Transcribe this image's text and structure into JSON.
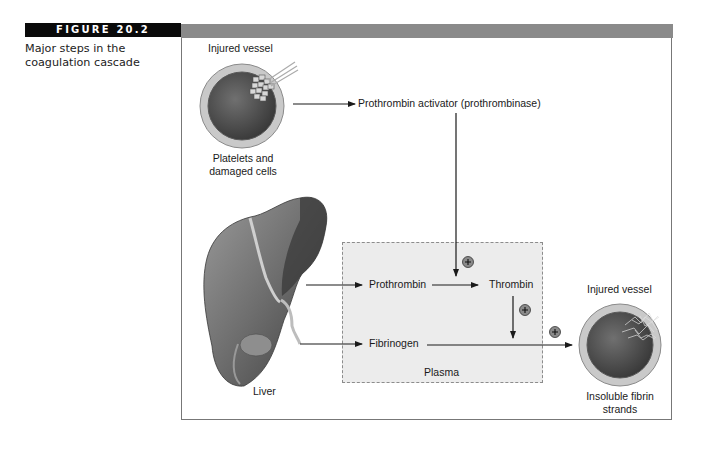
{
  "figure": {
    "number_label": "FIGURE 20.2",
    "caption_line1": "Major steps in the",
    "caption_line2": "coagulation cascade"
  },
  "diagram": {
    "injured_vessel_top": {
      "title": "Injured vessel",
      "sublabel_line1": "Platelets and",
      "sublabel_line2": "damaged cells"
    },
    "activator_label": "Prothrombin activator (prothrombinase)",
    "liver_label": "Liver",
    "plasma": {
      "label": "Plasma",
      "prothrombin": "Prothrombin",
      "thrombin": "Thrombin",
      "fibrinogen": "Fibrinogen"
    },
    "plus_symbol": "+",
    "injured_vessel_bottom": {
      "title": "Injured vessel",
      "sublabel_line1": "Insoluble fibrin",
      "sublabel_line2": "strands"
    },
    "colors": {
      "header_black": "#0a0a0a",
      "header_gray": "#8a8a8a",
      "plasma_fill": "#ececec",
      "vessel_rim": "#c8c8c8",
      "vessel_lumen": "#4a4a4a",
      "arrow": "#1a1a1a"
    }
  }
}
